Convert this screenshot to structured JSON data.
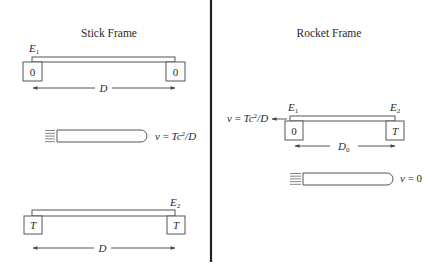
{
  "stick_frame": {
    "title": "Stick Frame",
    "top_stick": {
      "event_letter": "E",
      "event_sub": "1",
      "left_clock": "0",
      "right_clock": "0",
      "length_label": "D"
    },
    "rocket": {
      "velocity": {
        "v": "v",
        "eq": " = ",
        "expr": "Tc",
        "sup": "2",
        "rest": "/D"
      }
    },
    "bottom_stick": {
      "event_letter": "E",
      "event_sub": "2",
      "left_clock": "T",
      "right_clock": "T",
      "length_label": "D"
    }
  },
  "rocket_frame": {
    "title": "Rocket Frame",
    "stick": {
      "event1_letter": "E",
      "event1_sub": "1",
      "event2_letter": "E",
      "event2_sub": "2",
      "left_clock": "0",
      "right_clock": "T",
      "length_label": "D",
      "length_sub": "0",
      "velocity": {
        "v": "v",
        "eq": " = ",
        "expr": "Tc",
        "sup": "2",
        "rest": "/D"
      }
    },
    "rocket": {
      "velocity": {
        "v": "v",
        "eq": " = 0"
      }
    }
  }
}
